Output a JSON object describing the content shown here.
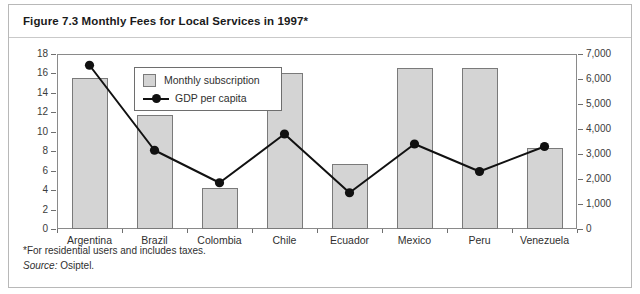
{
  "figure": {
    "title": "Figure 7.3 Monthly Fees for Local Services in 1997*",
    "footnote": "*For residential users and includes taxes.",
    "source_label": "Source:",
    "source_value": "Osiptel."
  },
  "legend": {
    "bar_label": "Monthly subscription",
    "line_label": "GDP per capita"
  },
  "colors": {
    "bar_fill": "#d4d4d4",
    "bar_stroke": "#7a7a7a",
    "line": "#111111",
    "frame": "#8a8a8a",
    "border": "#b8b8b8"
  },
  "chart_data": {
    "type": "bar",
    "title": "Figure 7.3 Monthly Fees for Local Services in 1997*",
    "xlabel": "",
    "ylabel": "",
    "grid": false,
    "legend_position": "inside-top-left",
    "categories": [
      "Argentina",
      "Brazil",
      "Colombia",
      "Chile",
      "Ecuador",
      "Mexico",
      "Peru",
      "Venezuela"
    ],
    "series": [
      {
        "name": "Monthly subscription",
        "type": "bar",
        "axis": "left",
        "values": [
          15.5,
          11.7,
          4.2,
          16.0,
          6.7,
          16.6,
          16.6,
          8.3
        ]
      },
      {
        "name": "GDP per capita",
        "type": "line",
        "axis": "right",
        "values": [
          6550,
          3150,
          1850,
          3800,
          1450,
          3400,
          2300,
          3300
        ]
      }
    ],
    "ylim": [
      0,
      18
    ],
    "yticks": [
      0,
      2,
      4,
      6,
      8,
      10,
      12,
      14,
      16,
      18
    ],
    "ytick_labels": [
      "0",
      "2",
      "4",
      "6",
      "8",
      "10",
      "12",
      "14",
      "16",
      "18"
    ],
    "y2lim": [
      0,
      7000
    ],
    "y2ticks": [
      0,
      1000,
      2000,
      3000,
      4000,
      5000,
      6000,
      7000
    ],
    "y2tick_labels": [
      "0",
      "1,000",
      "2,000",
      "3,000",
      "4,000",
      "5,000",
      "6,000",
      "7,000"
    ]
  }
}
